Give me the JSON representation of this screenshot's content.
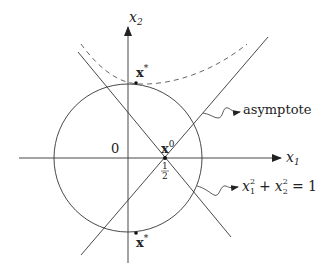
{
  "diagram": {
    "axes": {
      "x_label": "x",
      "x_sub": "1",
      "y_label": "x",
      "y_sub": "2",
      "origin_label": "0"
    },
    "points": {
      "top_point_label": "x",
      "top_point_sup": "*",
      "bottom_point_label": "x",
      "bottom_point_sup": "*",
      "center_point_label": "x",
      "center_point_sup": "0",
      "center_tick_num": "1",
      "center_tick_den": "2"
    },
    "annotations": {
      "asymptote_label": "asymptote",
      "circle_eq_x": "x",
      "circle_eq_sub1": "1",
      "circle_eq_sup1": "2",
      "circle_eq_plus": "+",
      "circle_eq_y": "x",
      "circle_eq_sub2": "2",
      "circle_eq_sup2": "2",
      "circle_eq_rhs": "= 1"
    },
    "colors": {
      "stroke": "#333333",
      "dashed": "#555555"
    }
  }
}
